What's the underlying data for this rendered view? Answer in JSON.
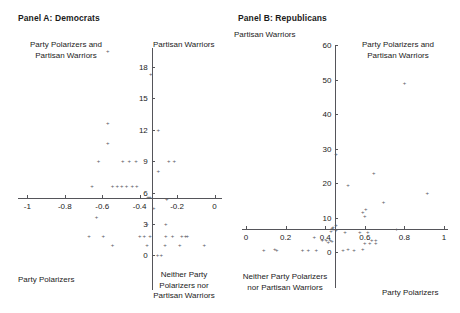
{
  "figure": {
    "background": "#ffffff",
    "marker_color": "#5a5a5f",
    "axis_color": "#55555a"
  },
  "panels": [
    {
      "id": "panel-a",
      "title": "Panel A: Democrats",
      "quadrant_labels": {
        "top_left": "Party Polarizers and\nPartisan Warriors",
        "top_right": "Partisan Warriors",
        "bottom_left": "Party Polarizers",
        "bottom_right": "Neither Party\nPolarizers nor\nPartisan Warriors"
      }
    },
    {
      "id": "panel-b",
      "title": "Panel B: Republicans",
      "quadrant_labels": {
        "top_left": "Partisan Warriors",
        "top_right": "Party Polarizers and\nPartisan Warriors",
        "bottom_left": "Neither Party Polarizers\nnor Partisan Warriors",
        "bottom_right": "Party Polarizers"
      }
    }
  ],
  "chart_data": [
    {
      "type": "scatter",
      "title": "Panel A: Democrats",
      "xlabel": "",
      "ylabel": "",
      "xlim": [
        -1.05,
        0.04
      ],
      "ylim": [
        -1.2,
        19.8
      ],
      "xticks": [
        -1,
        -0.8,
        -0.6,
        -0.4,
        -0.2,
        0
      ],
      "xticklabels": [
        "-1",
        "-0.8",
        "-0.6",
        "-0.4",
        "-0.2",
        "0"
      ],
      "yticks": [
        0,
        3,
        6,
        9,
        12,
        15,
        18
      ],
      "yticklabels": [
        "0",
        "3",
        "6",
        "9",
        "12",
        "15",
        "18"
      ],
      "grid": false,
      "legend": false,
      "axis_origin": {
        "x": -0.335,
        "y": 5.5
      },
      "marker": "plus",
      "points": [
        {
          "x": -0.57,
          "y": 19.5
        },
        {
          "x": -0.34,
          "y": 17.3
        },
        {
          "x": -0.57,
          "y": 12.6
        },
        {
          "x": -0.3,
          "y": 12.0
        },
        {
          "x": -0.57,
          "y": 10.7
        },
        {
          "x": -0.62,
          "y": 9.0
        },
        {
          "x": -0.49,
          "y": 9.0
        },
        {
          "x": -0.455,
          "y": 9.0
        },
        {
          "x": -0.42,
          "y": 9.0
        },
        {
          "x": -0.245,
          "y": 9.0
        },
        {
          "x": -0.215,
          "y": 9.0
        },
        {
          "x": -0.3,
          "y": 8.1
        },
        {
          "x": -0.655,
          "y": 6.6
        },
        {
          "x": -0.545,
          "y": 6.6
        },
        {
          "x": -0.52,
          "y": 6.6
        },
        {
          "x": -0.495,
          "y": 6.6
        },
        {
          "x": -0.47,
          "y": 6.6
        },
        {
          "x": -0.44,
          "y": 6.6
        },
        {
          "x": -0.415,
          "y": 6.6
        },
        {
          "x": -0.355,
          "y": 5.6
        },
        {
          "x": -0.345,
          "y": 5.55
        },
        {
          "x": -0.255,
          "y": 5.35
        },
        {
          "x": -0.325,
          "y": 4.5
        },
        {
          "x": -0.63,
          "y": 3.7
        },
        {
          "x": -0.36,
          "y": 3.0
        },
        {
          "x": -0.26,
          "y": 3.0
        },
        {
          "x": -0.67,
          "y": 1.9
        },
        {
          "x": -0.595,
          "y": 1.9
        },
        {
          "x": -0.4,
          "y": 1.9
        },
        {
          "x": -0.375,
          "y": 1.9
        },
        {
          "x": -0.345,
          "y": 1.9
        },
        {
          "x": -0.26,
          "y": 1.9
        },
        {
          "x": -0.225,
          "y": 1.9
        },
        {
          "x": -0.175,
          "y": 1.9
        },
        {
          "x": -0.155,
          "y": 1.9
        },
        {
          "x": -0.145,
          "y": 1.9
        },
        {
          "x": -0.545,
          "y": 1.0
        },
        {
          "x": -0.36,
          "y": 1.0
        },
        {
          "x": -0.265,
          "y": 1.0
        },
        {
          "x": -0.185,
          "y": 1.0
        },
        {
          "x": -0.055,
          "y": 1.0
        },
        {
          "x": -0.305,
          "y": 0.0
        },
        {
          "x": -0.285,
          "y": 0.0
        }
      ]
    },
    {
      "type": "scatter",
      "title": "Panel B: Republicans",
      "xlabel": "",
      "ylabel": "",
      "xlim": [
        -0.02,
        1.02
      ],
      "ylim": [
        -4,
        60
      ],
      "xticks": [
        0,
        0.2,
        0.4,
        0.6,
        0.8,
        1
      ],
      "xticklabels": [
        "0",
        "0.2",
        "0.4",
        "0.6",
        "0.8",
        "1"
      ],
      "yticks": [
        0,
        10,
        20,
        30,
        40,
        50,
        60
      ],
      "yticklabels": [
        "0",
        "10",
        "20",
        "30",
        "40",
        "50",
        "60"
      ],
      "grid": false,
      "legend": false,
      "axis_origin": {
        "x": 0.452,
        "y": 6.8
      },
      "marker": "plus",
      "points": [
        {
          "x": 0.8,
          "y": 49.0
        },
        {
          "x": 0.455,
          "y": 28.5
        },
        {
          "x": 0.645,
          "y": 23.0
        },
        {
          "x": 0.515,
          "y": 19.5
        },
        {
          "x": 0.915,
          "y": 17.2
        },
        {
          "x": 0.695,
          "y": 14.5
        },
        {
          "x": 0.605,
          "y": 12.5
        },
        {
          "x": 0.59,
          "y": 11.6
        },
        {
          "x": 0.6,
          "y": 10.6
        },
        {
          "x": 0.455,
          "y": 8.0
        },
        {
          "x": 0.44,
          "y": 7.4
        },
        {
          "x": 0.435,
          "y": 7.0
        },
        {
          "x": 0.44,
          "y": 6.6
        },
        {
          "x": 0.455,
          "y": 6.4
        },
        {
          "x": 0.76,
          "y": 6.8
        },
        {
          "x": 0.43,
          "y": 6.0
        },
        {
          "x": 0.5,
          "y": 5.9
        },
        {
          "x": 0.575,
          "y": 5.9
        },
        {
          "x": 0.615,
          "y": 5.9
        },
        {
          "x": 0.345,
          "y": 4.4
        },
        {
          "x": 0.385,
          "y": 3.6
        },
        {
          "x": 0.405,
          "y": 3.6
        },
        {
          "x": 0.425,
          "y": 3.6
        },
        {
          "x": 0.435,
          "y": 3.3
        },
        {
          "x": 0.415,
          "y": 2.9
        },
        {
          "x": 0.635,
          "y": 3.4
        },
        {
          "x": 0.655,
          "y": 3.4
        },
        {
          "x": 0.6,
          "y": 2.6
        },
        {
          "x": 0.625,
          "y": 2.6
        },
        {
          "x": 0.655,
          "y": 2.6
        },
        {
          "x": 0.09,
          "y": 0.6
        },
        {
          "x": 0.145,
          "y": 0.9
        },
        {
          "x": 0.155,
          "y": 0.6
        },
        {
          "x": 0.285,
          "y": 0.6
        },
        {
          "x": 0.315,
          "y": 0.6
        },
        {
          "x": 0.355,
          "y": 0.6
        },
        {
          "x": 0.49,
          "y": 0.6
        },
        {
          "x": 0.515,
          "y": 0.9
        },
        {
          "x": 0.545,
          "y": 0.6
        },
        {
          "x": 0.59,
          "y": 0.9
        }
      ]
    }
  ]
}
